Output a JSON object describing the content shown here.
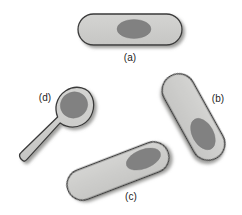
{
  "figure": {
    "background_color": "#ffffff",
    "width": 242,
    "height": 215
  },
  "style": {
    "body_fill": "#cbcbc9",
    "body_fill_light": "#d6d6d4",
    "nucleoid_fill": "#818181",
    "outline_color": "#3a3a3a",
    "shadow_color": "#9b9b99",
    "label_color": "#232323",
    "outline_width": 1.3,
    "label_font_size": 10
  },
  "cells": [
    {
      "id": "a",
      "name": "cell-a",
      "description": "horizontal rod-shaped cell with central nucleoid",
      "body": {
        "shape": "capsule",
        "cx": 130,
        "cy": 29.5,
        "length": 104,
        "width": 31,
        "rotation": 0
      },
      "nucleoid": {
        "shape": "ellipse",
        "cx": 134,
        "cy": 29,
        "rx": 17,
        "ry": 9.5,
        "rotation": 0
      },
      "label": {
        "text": "(a)",
        "x": 130,
        "y": 57
      }
    },
    {
      "id": "b",
      "name": "cell-b",
      "description": "rod-shaped cell tilted down to the right with nucleoid near lower end",
      "body": {
        "shape": "capsule",
        "cx": 193.5,
        "cy": 117,
        "length": 94,
        "width": 33,
        "rotation": 61
      },
      "nucleoid": {
        "shape": "ellipse",
        "cx": 202,
        "cy": 134,
        "rx": 17,
        "ry": 10.5,
        "rotation": 61
      },
      "label": {
        "text": "(b)",
        "x": 218,
        "y": 98
      }
    },
    {
      "id": "c",
      "name": "cell-c",
      "description": "rod-shaped cell tilted up to the right with nucleoid near upper-right end",
      "body": {
        "shape": "capsule",
        "cx": 118,
        "cy": 171,
        "length": 107,
        "width": 31,
        "rotation": -21
      },
      "nucleoid": {
        "shape": "ellipse",
        "cx": 144,
        "cy": 161,
        "rx": 18,
        "ry": 9.5,
        "rotation": -21
      },
      "label": {
        "text": "(c)",
        "x": 131,
        "y": 196
      }
    },
    {
      "id": "d",
      "name": "cell-d",
      "description": "spoon or tadpole shaped cell with round head and tapering stalk to lower left",
      "body": {
        "shape": "tadpole",
        "head_cx": 73,
        "head_cy": 106,
        "head_rx": 20,
        "head_ry": 19,
        "tail_tip_x": 21,
        "tail_tip_y": 157,
        "tail_width": 7
      },
      "nucleoid": {
        "shape": "ellipse",
        "cx": 74,
        "cy": 104,
        "rx": 13.5,
        "ry": 13,
        "rotation": -20
      },
      "label": {
        "text": "(d)",
        "x": 45,
        "y": 97
      }
    }
  ]
}
